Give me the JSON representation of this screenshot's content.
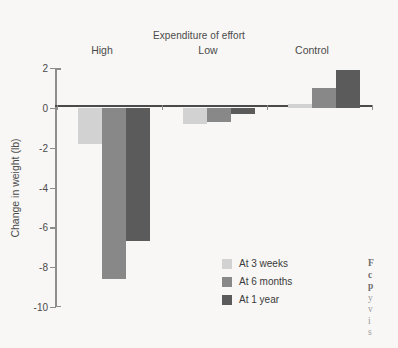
{
  "chart_data": {
    "type": "bar",
    "title": "Expenditure of effort",
    "xlabel": "",
    "ylabel": "Change in weight (lb)",
    "categories": [
      "High",
      "Low",
      "Control"
    ],
    "series": [
      {
        "name": "At 3 weeks",
        "values": [
          -1.8,
          -0.8,
          0.2
        ],
        "color": "#d2d2d2"
      },
      {
        "name": "At 6 months",
        "values": [
          -8.6,
          -0.7,
          1.0
        ],
        "color": "#888888"
      },
      {
        "name": "At 1 year",
        "values": [
          -6.7,
          -0.3,
          1.9
        ],
        "color": "#5b5b5b"
      }
    ],
    "ylim": [
      -10,
      2
    ],
    "yticks": [
      2,
      0,
      -2,
      -4,
      -6,
      -8,
      -10
    ],
    "ytick_labels": [
      "2",
      "0",
      "-2",
      "-4",
      "-6",
      "-8",
      "-10"
    ],
    "grid": false,
    "legend_position": "inside-bottom-right",
    "zero_line": true
  },
  "legend": {
    "items": [
      {
        "label": "At 3 weeks"
      },
      {
        "label": "At 6 months"
      },
      {
        "label": "At 1 year"
      }
    ]
  },
  "caption": {
    "lines": [
      "F",
      "c",
      "p",
      "y",
      "v",
      "i",
      "s"
    ]
  }
}
